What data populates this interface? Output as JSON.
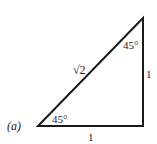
{
  "figure": {
    "label": "(a)",
    "hypotenuse_label": "√2",
    "vertical_leg_label": "1",
    "horizontal_leg_label": "1",
    "bottom_angle_label": "45°",
    "top_angle_label": "45°",
    "stroke_color": "#1a1a1a"
  }
}
